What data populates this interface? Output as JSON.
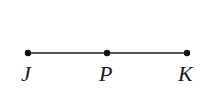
{
  "diagram": {
    "type": "line-segment",
    "segment": {
      "from": "J",
      "to": "K"
    },
    "points": [
      {
        "label": "J",
        "x": 28,
        "y": 53
      },
      {
        "label": "P",
        "x": 107,
        "y": 53
      },
      {
        "label": "K",
        "x": 187,
        "y": 53
      }
    ],
    "colors": {
      "line": "#1a1a1a",
      "point": "#111111",
      "label": "#1a1a1a"
    }
  }
}
